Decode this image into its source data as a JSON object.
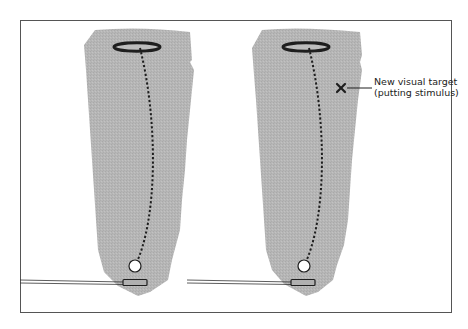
{
  "diagram": {
    "type": "putting-green-comparison",
    "colors": {
      "green": "#b4b4b4",
      "frame": "#555555",
      "ink": "#1e1e1e",
      "background": "#ffffff"
    },
    "panels": [
      {
        "name": "original-target",
        "has_new_target": false
      },
      {
        "name": "new-visual-target",
        "has_new_target": true
      }
    ],
    "annotation": {
      "marker": "x-mark-icon",
      "line1": "New visual target",
      "line2": "(putting stimulus)"
    }
  }
}
